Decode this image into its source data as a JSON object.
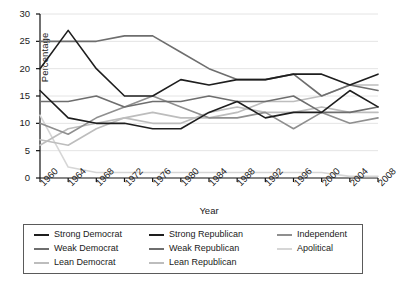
{
  "chart_data": {
    "type": "line",
    "title": "",
    "xlabel": "Year",
    "ylabel": "Percentage",
    "xlim": [
      1960,
      2008
    ],
    "ylim": [
      0,
      30
    ],
    "grid": true,
    "legend_position": "bottom",
    "x": [
      1960,
      1964,
      1968,
      1972,
      1976,
      1980,
      1984,
      1988,
      1992,
      1996,
      2000,
      2004,
      2008
    ],
    "xtick_labels": [
      "1960",
      "1964",
      "1968",
      "1972",
      "1976",
      "1980",
      "1984",
      "1988",
      "1992",
      "1996",
      "2000",
      "2004",
      "2008"
    ],
    "ytick_labels": [
      "0",
      "5",
      "10",
      "15",
      "20",
      "25",
      "30"
    ],
    "ytick_values": [
      0,
      5,
      10,
      15,
      20,
      25,
      30
    ],
    "series": [
      {
        "name": "Strong Democrat",
        "color": "#1e1e1e",
        "values": [
          20,
          27,
          20,
          15,
          15,
          18,
          17,
          18,
          18,
          19,
          19,
          17,
          19
        ]
      },
      {
        "name": "Weak Democrat",
        "color": "#6e6e6e",
        "values": [
          25,
          25,
          25,
          26,
          26,
          23,
          20,
          18,
          18,
          19,
          15,
          17,
          16
        ]
      },
      {
        "name": "Lean Democrat",
        "color": "#bdbdbd",
        "values": [
          6,
          9,
          10,
          11,
          12,
          11,
          11,
          12,
          14,
          14,
          15,
          17,
          17
        ]
      },
      {
        "name": "Strong Republican",
        "color": "#1e1e1e",
        "values": [
          16,
          11,
          10,
          10,
          9,
          9,
          12,
          14,
          11,
          12,
          12,
          16,
          13
        ]
      },
      {
        "name": "Weak Republican",
        "color": "#6e6e6e",
        "values": [
          14,
          14,
          15,
          13,
          14,
          14,
          15,
          14,
          14,
          15,
          12,
          12,
          13
        ]
      },
      {
        "name": "Lean Republican",
        "color": "#bdbdbd",
        "values": [
          7,
          6,
          9,
          11,
          10,
          10,
          12,
          13,
          12,
          12,
          13,
          12,
          12
        ]
      },
      {
        "name": "Independent",
        "color": "#8f8f8f",
        "values": [
          10,
          8,
          11,
          13,
          15,
          13,
          11,
          11,
          12,
          9,
          12,
          10,
          11
        ]
      },
      {
        "name": "Apolitical",
        "color": "#d6d6d6",
        "values": [
          11.5,
          2,
          1,
          1,
          1,
          1,
          1,
          1,
          1,
          1,
          1,
          0.3,
          0.3
        ]
      }
    ],
    "legend_columns": [
      [
        "Strong Democrat",
        "Weak Democrat",
        "Lean Democrat"
      ],
      [
        "Strong Republican",
        "Weak Republican",
        "Lean Republican"
      ],
      [
        "Independent",
        "Apolitical"
      ]
    ]
  }
}
